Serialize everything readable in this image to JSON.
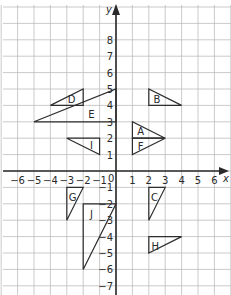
{
  "diagram": {
    "type": "coordinate-grid",
    "x_axis_label": "x",
    "y_axis_label": "y",
    "origin_label": "0",
    "grid": {
      "xmin": -7,
      "xmax": 7,
      "ymin": -8,
      "ymax": 10
    },
    "x_ticks": [
      -6,
      -5,
      -4,
      -3,
      -2,
      -1,
      1,
      2,
      3,
      4,
      5,
      6
    ],
    "y_ticks": [
      8,
      7,
      6,
      5,
      4,
      3,
      2,
      1,
      -1,
      -2,
      -3,
      -4,
      -5,
      -6,
      -7
    ],
    "shapes": [
      {
        "label": "A",
        "vertices": [
          [
            1,
            3
          ],
          [
            1,
            2
          ],
          [
            3,
            2
          ]
        ],
        "label_pos": [
          1.5,
          2.45
        ]
      },
      {
        "label": "B",
        "vertices": [
          [
            2,
            5
          ],
          [
            2,
            4
          ],
          [
            4,
            4
          ]
        ],
        "label_pos": [
          2.5,
          4.4
        ]
      },
      {
        "label": "C",
        "vertices": [
          [
            2,
            -1
          ],
          [
            3,
            -1
          ],
          [
            2,
            -3
          ]
        ],
        "label_pos": [
          2.35,
          -1.6
        ]
      },
      {
        "label": "D",
        "vertices": [
          [
            -4,
            4
          ],
          [
            -2,
            5
          ],
          [
            -2,
            4
          ]
        ],
        "label_pos": [
          -2.7,
          4.4
        ]
      },
      {
        "label": "E",
        "vertices": [
          [
            -5,
            3
          ],
          [
            0,
            5
          ],
          [
            0,
            3
          ]
        ],
        "label_pos": [
          -1.5,
          3.45
        ]
      },
      {
        "label": "F",
        "vertices": [
          [
            1,
            2
          ],
          [
            3,
            2
          ],
          [
            1,
            1
          ]
        ],
        "label_pos": [
          1.5,
          1.55
        ]
      },
      {
        "label": "G",
        "vertices": [
          [
            -3,
            -1
          ],
          [
            -2,
            -1
          ],
          [
            -3,
            -3
          ]
        ],
        "label_pos": [
          -2.65,
          -1.6
        ]
      },
      {
        "label": "H",
        "vertices": [
          [
            2,
            -4
          ],
          [
            4,
            -4
          ],
          [
            2,
            -5
          ]
        ],
        "label_pos": [
          2.4,
          -4.55
        ]
      },
      {
        "label": "I",
        "vertices": [
          [
            -3,
            2
          ],
          [
            -1,
            2
          ],
          [
            -1,
            1
          ]
        ],
        "label_pos": [
          -1.5,
          1.6
        ]
      },
      {
        "label": "J",
        "vertices": [
          [
            -2,
            -2
          ],
          [
            0,
            -2
          ],
          [
            -2,
            -6
          ]
        ],
        "label_pos": [
          -1.5,
          -2.6
        ]
      }
    ]
  },
  "colors": {
    "ink": "#2e2e2e",
    "grid": "#bdbdbd",
    "background": "#ffffff"
  }
}
